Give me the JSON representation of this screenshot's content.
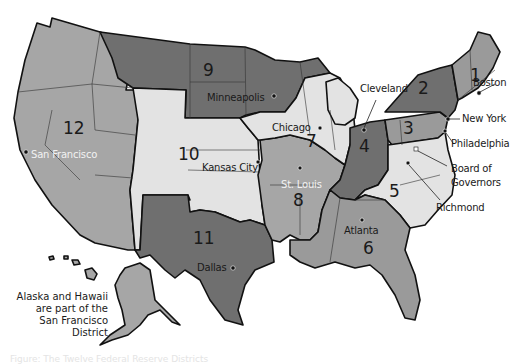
{
  "title": "Federal Reserve Districts",
  "colors": {
    "dark": "#707070",
    "medium": "#9a9a9a",
    "mediumLight": "#a9a9a9",
    "light": "#e3e3e3",
    "border": "#111111",
    "background": "#ffffff"
  },
  "districts": [
    {
      "number": "1",
      "bank": "Boston",
      "shade": "medium"
    },
    {
      "number": "2",
      "bank": "New York",
      "shade": "dark"
    },
    {
      "number": "3",
      "bank": "Philadelphia",
      "shade": "medium"
    },
    {
      "number": "4",
      "bank": "Cleveland",
      "shade": "dark"
    },
    {
      "number": "5",
      "bank": "Richmond",
      "shade": "light"
    },
    {
      "number": "6",
      "bank": "Atlanta",
      "shade": "medium"
    },
    {
      "number": "7",
      "bank": "Chicago",
      "shade": "light"
    },
    {
      "number": "8",
      "bank": "St. Louis",
      "shade": "medium"
    },
    {
      "number": "9",
      "bank": "Minneapolis",
      "shade": "dark"
    },
    {
      "number": "10",
      "bank": "Kansas City",
      "shade": "light"
    },
    {
      "number": "11",
      "bank": "Dallas",
      "shade": "dark"
    },
    {
      "number": "12",
      "bank": "San Francisco",
      "shade": "medium"
    }
  ],
  "labels": {
    "board": "Board of",
    "governors": "Governors"
  },
  "note": {
    "line1": "Alaska and Hawaii",
    "line2": "are part of the",
    "line3": "San Francisco District"
  },
  "caption": "Figure: The Twelve Federal Reserve Districts"
}
